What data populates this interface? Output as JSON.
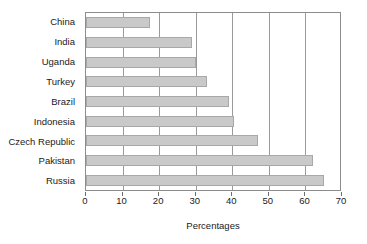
{
  "chart_data": {
    "type": "bar",
    "orientation": "horizontal",
    "title": "",
    "xlabel": "Percentages",
    "ylabel": "",
    "categories": [
      "China",
      "India",
      "Uganda",
      "Turkey",
      "Brazil",
      "Indonesia",
      "Czech Republic",
      "Pakistan",
      "Russia"
    ],
    "values": [
      17.5,
      29,
      30,
      33,
      39,
      40.5,
      47,
      62,
      65
    ],
    "xlim": [
      0,
      70
    ],
    "xticks": [
      0,
      10,
      20,
      30,
      40,
      50,
      60,
      70
    ],
    "xtick_labels": [
      "0",
      "10",
      "20",
      "30",
      "40",
      "50",
      "60",
      "70"
    ],
    "grid": "vertical",
    "legend": "none",
    "bar_color": "#c9c9c9",
    "bar_border_color": "#a8a8a8",
    "gridline_color": "#9a9a9a",
    "axis_color": "#8c8c8c"
  }
}
